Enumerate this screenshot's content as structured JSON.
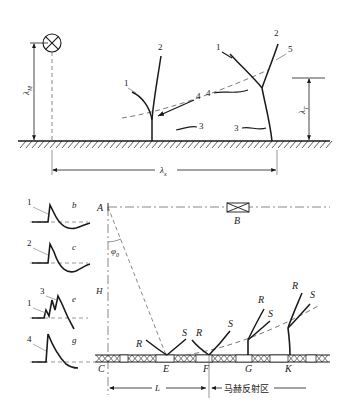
{
  "figure": {
    "line_color": "#1a1a1a",
    "dash_color": "#6a6a6a"
  },
  "upper_panel": {
    "name": "upper-panel",
    "burst_symbol": "burst-point-icon",
    "dimensions": [
      {
        "id": "height-of-burst",
        "lambda": "λ",
        "subscript": "M",
        "orientation": "vertical-left"
      },
      {
        "id": "ground-range",
        "lambda": "λ",
        "subscript": "x",
        "orientation": "horizontal-bottom"
      },
      {
        "id": "triple-point-height",
        "lambda": "λ",
        "subscript": "T",
        "orientation": "vertical-right"
      }
    ],
    "callouts_left": [
      "1",
      "2",
      "3",
      "4"
    ],
    "callouts_right": [
      "1",
      "2",
      "3",
      "4",
      "5"
    ],
    "legend_meaning": {
      "1": "incident shock",
      "2": "reflected shock",
      "3": "Mach stem",
      "4": "triple point",
      "5": "triple point trajectory"
    }
  },
  "lower_panel": {
    "name": "lower-panel",
    "points": [
      "A",
      "B",
      "C",
      "E",
      "F",
      "G",
      "K"
    ],
    "angle_label": "φ",
    "angle_subscript": "0",
    "height_label": "H",
    "length_label": "L",
    "zone_label": "马赫反射区",
    "shock_labels": [
      "R",
      "S",
      "R",
      "S",
      "S",
      "R",
      "S",
      "R",
      "S"
    ],
    "target_symbol": "bowtie-target-icon"
  },
  "waveforms": [
    {
      "id": "waveform-b",
      "letter": "b",
      "callouts": [
        "1"
      ]
    },
    {
      "id": "waveform-c",
      "letter": "c",
      "callouts": [
        "2"
      ]
    },
    {
      "id": "waveform-e",
      "letter": "e",
      "callouts": [
        "3",
        "1"
      ]
    },
    {
      "id": "waveform-g",
      "letter": "g",
      "callouts": [
        "4"
      ]
    }
  ]
}
